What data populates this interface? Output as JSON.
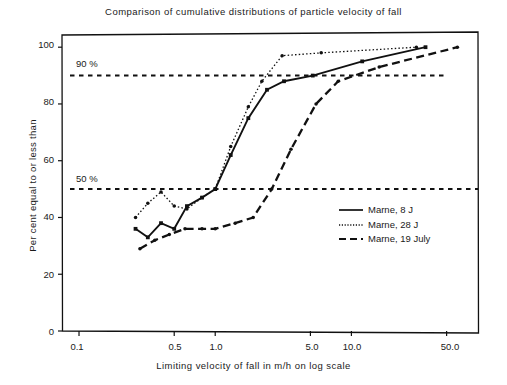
{
  "chart_data": {
    "type": "line",
    "title": "Comparison of cumulative distributions of particle velocity of fall",
    "xlabel": "Limiting velocity of fall in m/h on log scale",
    "ylabel": "Per cent equal to or less than",
    "xscale": "log",
    "xlim": [
      0.075,
      85
    ],
    "ylim": [
      0,
      105
    ],
    "xticks": [
      0.1,
      0.5,
      1.0,
      5.0,
      10.0,
      50.0
    ],
    "xticklabels": [
      "0.1",
      "0.5",
      "1.0",
      "5.0",
      "10.0",
      "50.0"
    ],
    "yticks": [
      0,
      20,
      40,
      60,
      80,
      100
    ],
    "yticklabels": [
      "0",
      "20",
      "40",
      "60",
      "80",
      "100"
    ],
    "grid": false,
    "legend_position": "lower right",
    "reference_lines": [
      {
        "label": "90 %",
        "value": 90,
        "style": "dashed"
      },
      {
        "label": "50 %",
        "value": 50,
        "style": "dashed"
      }
    ],
    "series": [
      {
        "name": "Marne, 8 J",
        "style": "solid",
        "marker": "square",
        "points": [
          {
            "x": 0.26,
            "y": 36
          },
          {
            "x": 0.32,
            "y": 33
          },
          {
            "x": 0.4,
            "y": 38
          },
          {
            "x": 0.5,
            "y": 36
          },
          {
            "x": 0.62,
            "y": 44
          },
          {
            "x": 0.8,
            "y": 47
          },
          {
            "x": 1.0,
            "y": 50
          },
          {
            "x": 1.3,
            "y": 62
          },
          {
            "x": 1.75,
            "y": 75
          },
          {
            "x": 2.4,
            "y": 85
          },
          {
            "x": 3.2,
            "y": 88
          },
          {
            "x": 5.2,
            "y": 90
          },
          {
            "x": 12.0,
            "y": 95
          },
          {
            "x": 35.0,
            "y": 100
          }
        ]
      },
      {
        "name": "Marne, 28 J",
        "style": "dotted",
        "marker": "dot",
        "points": [
          {
            "x": 0.26,
            "y": 40
          },
          {
            "x": 0.32,
            "y": 45
          },
          {
            "x": 0.4,
            "y": 49
          },
          {
            "x": 0.5,
            "y": 44
          },
          {
            "x": 0.62,
            "y": 43
          },
          {
            "x": 0.8,
            "y": 47
          },
          {
            "x": 1.0,
            "y": 50
          },
          {
            "x": 1.3,
            "y": 65
          },
          {
            "x": 1.75,
            "y": 79
          },
          {
            "x": 2.2,
            "y": 88
          },
          {
            "x": 3.1,
            "y": 97
          },
          {
            "x": 6.0,
            "y": 98
          },
          {
            "x": 30.0,
            "y": 100
          }
        ]
      },
      {
        "name": "Marne, 19 July",
        "style": "dashed",
        "marker": "dot",
        "points": [
          {
            "x": 0.28,
            "y": 29
          },
          {
            "x": 0.36,
            "y": 32
          },
          {
            "x": 0.46,
            "y": 34
          },
          {
            "x": 0.6,
            "y": 36
          },
          {
            "x": 0.8,
            "y": 36
          },
          {
            "x": 1.0,
            "y": 36
          },
          {
            "x": 1.4,
            "y": 38
          },
          {
            "x": 1.9,
            "y": 40
          },
          {
            "x": 2.6,
            "y": 50
          },
          {
            "x": 3.6,
            "y": 64
          },
          {
            "x": 5.5,
            "y": 80
          },
          {
            "x": 8.0,
            "y": 88
          },
          {
            "x": 16.0,
            "y": 93
          },
          {
            "x": 60.0,
            "y": 100
          }
        ]
      }
    ]
  }
}
